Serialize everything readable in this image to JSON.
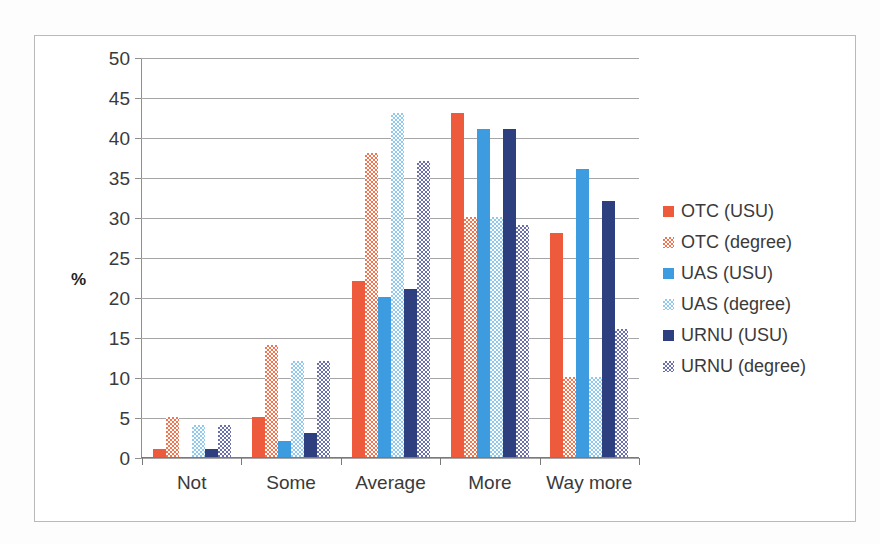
{
  "chart_data": {
    "type": "bar",
    "title": "",
    "xlabel": "",
    "ylabel": "%",
    "ylim": [
      0,
      50
    ],
    "ytick_step": 5,
    "yticks": [
      50,
      45,
      40,
      35,
      30,
      25,
      20,
      15,
      10,
      5,
      0
    ],
    "grid": true,
    "legend_position": "right",
    "categories": [
      "Not",
      "Some",
      "Average",
      "More",
      "Way more"
    ],
    "series": [
      {
        "name": "OTC (USU)",
        "color": "#ED5B3C",
        "pattern": "solid",
        "values": [
          1,
          5,
          22,
          43,
          28
        ]
      },
      {
        "name": "OTC (degree)",
        "color": "#F3754F",
        "pattern": "checkerboard",
        "values": [
          5,
          14,
          38,
          30,
          10
        ]
      },
      {
        "name": "UAS (USU)",
        "color": "#3D9BE0",
        "pattern": "solid",
        "values": [
          0,
          2,
          20,
          41,
          36
        ]
      },
      {
        "name": "UAS (degree)",
        "color": "#8FC9ED",
        "pattern": "checkerboard",
        "values": [
          4,
          12,
          43,
          30,
          10
        ]
      },
      {
        "name": "URNU (USU)",
        "color": "#2E3F7F",
        "pattern": "solid",
        "values": [
          1,
          3,
          21,
          41,
          32
        ]
      },
      {
        "name": "URNU (degree)",
        "color": "#6A6FAE",
        "pattern": "checkerboard",
        "values": [
          4,
          12,
          37,
          29,
          16
        ]
      }
    ]
  }
}
